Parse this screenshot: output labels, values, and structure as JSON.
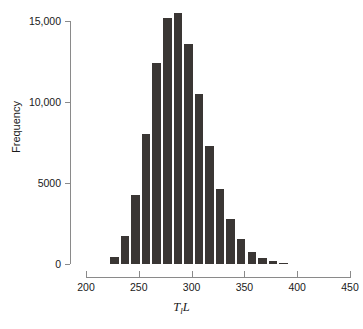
{
  "chart_data": {
    "type": "bar",
    "title": "",
    "subtitle": "",
    "xlabel": "T_l L",
    "ylabel": "Frequency",
    "xlim": [
      200,
      450
    ],
    "ylim": [
      0,
      15800
    ],
    "grid": false,
    "legend": null,
    "bin_width": 10,
    "bar_color": "#3a3634",
    "axis_color": "#8a8a8a",
    "x_ticks": [
      {
        "value": 200,
        "label": "200"
      },
      {
        "value": 250,
        "label": "250"
      },
      {
        "value": 300,
        "label": "300"
      },
      {
        "value": 350,
        "label": "350"
      },
      {
        "value": 400,
        "label": "400"
      },
      {
        "value": 450,
        "label": "450"
      }
    ],
    "y_ticks": [
      {
        "value": 0,
        "label": "0"
      },
      {
        "value": 5000,
        "label": "5000"
      },
      {
        "value": 10000,
        "label": "10,000"
      },
      {
        "value": 15000,
        "label": "15,000"
      }
    ],
    "bins": [
      {
        "x_start": 222,
        "x_end": 232,
        "value": 450
      },
      {
        "x_start": 232,
        "x_end": 242,
        "value": 1700
      },
      {
        "x_start": 242,
        "x_end": 252,
        "value": 4250
      },
      {
        "x_start": 252,
        "x_end": 262,
        "value": 8050
      },
      {
        "x_start": 262,
        "x_end": 272,
        "value": 12400
      },
      {
        "x_start": 272,
        "x_end": 282,
        "value": 15200
      },
      {
        "x_start": 282,
        "x_end": 292,
        "value": 15500
      },
      {
        "x_start": 292,
        "x_end": 302,
        "value": 13600
      },
      {
        "x_start": 302,
        "x_end": 312,
        "value": 10500
      },
      {
        "x_start": 312,
        "x_end": 322,
        "value": 7300
      },
      {
        "x_start": 322,
        "x_end": 332,
        "value": 4600
      },
      {
        "x_start": 332,
        "x_end": 342,
        "value": 2750
      },
      {
        "x_start": 342,
        "x_end": 352,
        "value": 1550
      },
      {
        "x_start": 352,
        "x_end": 362,
        "value": 750
      },
      {
        "x_start": 362,
        "x_end": 372,
        "value": 400
      },
      {
        "x_start": 372,
        "x_end": 382,
        "value": 180
      },
      {
        "x_start": 382,
        "x_end": 392,
        "value": 70
      }
    ],
    "categories": [
      227,
      237,
      247,
      257,
      267,
      277,
      287,
      297,
      307,
      317,
      327,
      337,
      347,
      357,
      367,
      377,
      387
    ],
    "values": [
      450,
      1700,
      4250,
      8050,
      12400,
      15200,
      15500,
      13600,
      10500,
      7300,
      4600,
      2750,
      1550,
      750,
      400,
      180,
      70
    ]
  }
}
